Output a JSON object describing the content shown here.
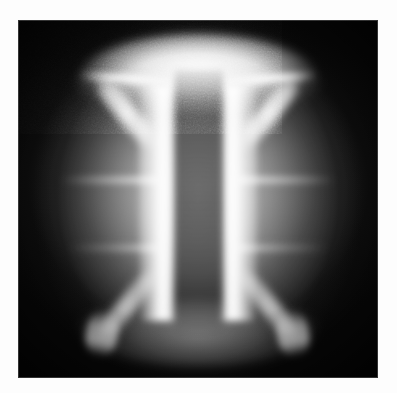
{
  "figure": {
    "caption": "",
    "medium": "grayscale-photograph",
    "plate": {
      "x": 18,
      "y": 20,
      "width": 360,
      "height": 358
    },
    "page_background": "#fdfdfd",
    "palette": {
      "background_black": "#080808",
      "deep_shadow": "#121212",
      "mid_gray": "#6e6e6e",
      "body_gray": "#9a9a9a",
      "bright_gray": "#d2d2d2",
      "highlight_white": "#fafafa"
    },
    "structures": [
      {
        "id": "top-flare",
        "label": "Upper anode flare",
        "shape": "trapezoidal funnel mouth",
        "brightness": "highest",
        "gray_level": 236,
        "x_extent_px": [
          85,
          310
        ],
        "y_extent_px": [
          48,
          105
        ]
      },
      {
        "id": "funnel-walls-upper",
        "label": "Upper converging walls",
        "shape": "pair of diagonal filaments",
        "brightness": "very high",
        "gray_level": 246,
        "angle_deg": 39
      },
      {
        "id": "vertical-bands",
        "label": "Paired bright column walls",
        "shape": "two vertical bright bands",
        "brightness": "maximum",
        "gray_level": 250,
        "x_centers_px": [
          150,
          246
        ],
        "y_extent_px": [
          85,
          320
        ]
      },
      {
        "id": "center-column",
        "label": "Dark central channel",
        "shape": "vertical gray column",
        "brightness": "medium-low",
        "gray_level": 128,
        "x_extent_px": [
          175,
          222
        ],
        "y_extent_px": [
          70,
          330
        ]
      },
      {
        "id": "horizontal-streaks-upper",
        "label": "Upper horizontal striations",
        "shape": "faint lateral streaks",
        "brightness": "low",
        "gray_level": 150,
        "y_px": 178
      },
      {
        "id": "horizontal-streaks-lower",
        "label": "Lower horizontal striations",
        "shape": "faint lateral streaks",
        "brightness": "very low",
        "gray_level": 128,
        "y_px": 246
      },
      {
        "id": "bottom-flare",
        "label": "Lower cathode flare",
        "shape": "inverted trapezoidal mouth",
        "brightness": "moderate",
        "gray_level": 150,
        "x_extent_px": [
          85,
          310
        ],
        "y_extent_px": [
          300,
          362
        ]
      },
      {
        "id": "background-vignette",
        "label": "Vignetted dark field",
        "shape": "radial falloff to frame edges",
        "brightness": "near black",
        "gray_level": 10
      }
    ],
    "texture": {
      "type": "film-grain",
      "amount": "heavy",
      "description": "dense analog photographic noise across entire plate"
    }
  }
}
